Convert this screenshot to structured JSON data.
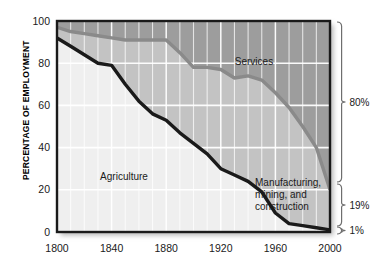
{
  "chart_data": {
    "type": "area",
    "title": "",
    "subtitle": "",
    "xlabel": "",
    "ylabel": "PERCENTAGE OF EMPLOYMENT",
    "xlim": [
      1800,
      2000
    ],
    "ylim": [
      0,
      100
    ],
    "grid": true,
    "stacked": true,
    "legend_position": "inline-labels",
    "x_ticks": [
      1800,
      1840,
      1880,
      1920,
      1960,
      2000
    ],
    "x_tick_labels": [
      "1800",
      "1840",
      "1880",
      "1920",
      "1960",
      "2000"
    ],
    "x_minor_gridline_step": 10,
    "y_ticks": [
      0,
      20,
      40,
      60,
      80,
      100
    ],
    "y_tick_labels": [
      "0",
      "20",
      "40",
      "60",
      "80",
      "100"
    ],
    "x": [
      1800,
      1810,
      1820,
      1830,
      1840,
      1850,
      1860,
      1870,
      1880,
      1890,
      1900,
      1910,
      1920,
      1930,
      1940,
      1950,
      1960,
      1970,
      1980,
      1990,
      2000
    ],
    "series": [
      {
        "name": "Agriculture",
        "label": "Agriculture",
        "color": "#efefef",
        "line_color": "#1a1a1a",
        "cumulative_top": [
          92,
          88,
          84,
          80,
          79,
          70,
          62,
          56,
          53,
          47,
          42,
          37,
          30,
          27,
          24,
          19,
          9,
          4,
          3,
          2,
          1
        ],
        "values": [
          92,
          88,
          84,
          80,
          79,
          70,
          62,
          56,
          53,
          47,
          42,
          37,
          30,
          27,
          24,
          19,
          9,
          4,
          3,
          2,
          1
        ],
        "end_value_percent": "1%"
      },
      {
        "name": "Manufacturing, mining, and construction",
        "label": "Manufacturing,\nmining, and\nconstruction",
        "label_lines": [
          "Manufacturing,",
          "mining, and",
          "construction"
        ],
        "color": "#c3c3c3",
        "line_color": "#8a8a8a",
        "cumulative_top": [
          97,
          95,
          94,
          93,
          92,
          91,
          91,
          91,
          91,
          85,
          78,
          78,
          77,
          73,
          74,
          72,
          66,
          59,
          50,
          40,
          20
        ],
        "values": [
          5,
          7,
          10,
          13,
          13,
          21,
          29,
          35,
          38,
          38,
          36,
          41,
          47,
          46,
          50,
          53,
          57,
          55,
          47,
          38,
          19
        ],
        "end_value_percent": "19%"
      },
      {
        "name": "Services",
        "label": "Services",
        "color": "#9d9d9d",
        "cumulative_top": [
          100,
          100,
          100,
          100,
          100,
          100,
          100,
          100,
          100,
          100,
          100,
          100,
          100,
          100,
          100,
          100,
          100,
          100,
          100,
          100,
          100
        ],
        "values": [
          3,
          5,
          6,
          7,
          8,
          9,
          9,
          9,
          9,
          15,
          22,
          22,
          23,
          27,
          26,
          28,
          34,
          41,
          50,
          60,
          80
        ],
        "end_value_percent": "80%"
      }
    ],
    "annotations": [
      {
        "name": "services-label",
        "text": "Services",
        "x_px": 254,
        "y_px": 62
      },
      {
        "name": "agriculture-label",
        "text": "Agriculture",
        "x_px": 124,
        "y_px": 177
      },
      {
        "name": "manufacturing-label",
        "lines": [
          "Manufacturing,",
          "mining, and",
          "construction"
        ],
        "x_px": 252,
        "y_px": 186
      }
    ],
    "right_brackets": [
      {
        "name": "services-bracket",
        "label": "80%",
        "top_px": 22,
        "bottom_px": 182
      },
      {
        "name": "manufacturing-bracket",
        "label": "19%",
        "top_px": 184,
        "bottom_px": 226
      },
      {
        "name": "agriculture-bracket",
        "label": "1%",
        "top_px": 227,
        "bottom_px": 234
      }
    ]
  },
  "colors": {
    "agriculture_fill": "#efefef",
    "manufacturing_fill": "#c3c3c3",
    "services_fill": "#9d9d9d",
    "agriculture_line": "#1a1a1a",
    "manufacturing_line": "#8a8a8a",
    "gridline": "#ffffff",
    "frame": "#1a1a1a",
    "text": "#1a1a1a",
    "background": "#ffffff"
  }
}
